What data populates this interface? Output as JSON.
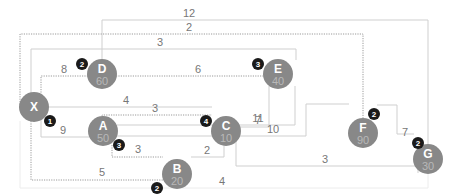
{
  "diagram": {
    "type": "weighted-network",
    "colors": {
      "node": "#888888",
      "badge": "#1a1a1a",
      "edge": "#cfcfcf",
      "edge_dotted": "#9a9a9a"
    },
    "nodes": [
      {
        "id": "X",
        "label": "X",
        "value": "",
        "badge": ""
      },
      {
        "id": "D",
        "label": "D",
        "value": "60",
        "badge": "2"
      },
      {
        "id": "E",
        "label": "E",
        "value": "40",
        "badge": "3"
      },
      {
        "id": "C",
        "label": "C",
        "value": "10",
        "badge": "4"
      },
      {
        "id": "F",
        "label": "F",
        "value": "90",
        "badge": "2"
      },
      {
        "id": "G",
        "label": "G",
        "value": "30",
        "badge": "2"
      },
      {
        "id": "A",
        "label": "A",
        "value": "50",
        "badge": "3"
      },
      {
        "id": "B",
        "label": "B",
        "value": "20",
        "badge": "2"
      }
    ],
    "x_badge": "1",
    "edges": [
      {
        "from": "D",
        "to": "G",
        "weight": "12",
        "style": "solid"
      },
      {
        "from": "X",
        "to": "F",
        "weight": "2",
        "style": "dotted"
      },
      {
        "from": "X",
        "to": "E",
        "weight": "3",
        "style": "solid"
      },
      {
        "from": "X",
        "to": "D",
        "weight": "8",
        "style": "dotted"
      },
      {
        "from": "D",
        "to": "E",
        "weight": "6",
        "style": "dotted"
      },
      {
        "from": "X",
        "to": "C",
        "weight": "4",
        "style": "solid"
      },
      {
        "from": "A",
        "to": "C",
        "weight": "3",
        "style": "dotted"
      },
      {
        "from": "C",
        "to": "E",
        "weight": "7",
        "style": "solid"
      },
      {
        "from": "X",
        "to": "A",
        "weight": "9",
        "style": "solid"
      },
      {
        "from": "A",
        "to": "E",
        "weight": "11",
        "style": "solid"
      },
      {
        "from": "A",
        "to": "F",
        "weight": "10",
        "style": "solid"
      },
      {
        "from": "A",
        "to": "B",
        "weight": "3",
        "style": "dotted"
      },
      {
        "from": "B",
        "to": "C",
        "weight": "2",
        "style": "solid"
      },
      {
        "from": "F",
        "to": "G",
        "weight": "7",
        "style": "solid"
      },
      {
        "from": "C",
        "to": "G",
        "weight": "3",
        "style": "solid"
      },
      {
        "from": "X",
        "to": "B",
        "weight": "5",
        "style": "dotted"
      },
      {
        "from": "X",
        "to": "G",
        "weight": "4",
        "style": "faint"
      }
    ]
  }
}
